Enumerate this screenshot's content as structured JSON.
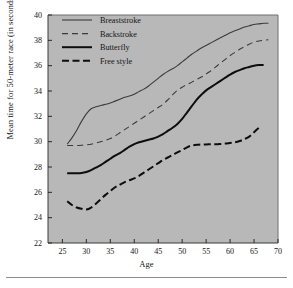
{
  "chart_data": {
    "type": "line",
    "title": "",
    "xlabel": "Age",
    "ylabel": "Mean time for 50-meter race (in seconds)",
    "xlim": [
      22,
      70
    ],
    "ylim": [
      22,
      40
    ],
    "xticks": [
      25,
      30,
      35,
      40,
      45,
      50,
      55,
      60,
      65,
      70
    ],
    "yticks": [
      22,
      24,
      26,
      28,
      30,
      32,
      34,
      36,
      38,
      40
    ],
    "grid": false,
    "legend_position": "top-left-inside",
    "plot_background": "#b8b8b8",
    "page_background": "#ffffff",
    "series": [
      {
        "name": "Breaststroke",
        "style": "thin-solid",
        "color": "#3b3b3b",
        "linewidth": 1.1,
        "dash": "none",
        "x": [
          26,
          27,
          28,
          29,
          30,
          31,
          32,
          33,
          34,
          35,
          36,
          37,
          38,
          39,
          40,
          41,
          42,
          43,
          44,
          45,
          46,
          47,
          48,
          49,
          50,
          51,
          52,
          53,
          54,
          55,
          56,
          57,
          58,
          59,
          60,
          61,
          62,
          63,
          64,
          65,
          66,
          67,
          68
        ],
        "y": [
          29.8,
          30.3,
          30.9,
          31.6,
          32.2,
          32.6,
          32.75,
          32.85,
          32.95,
          33.05,
          33.2,
          33.35,
          33.5,
          33.6,
          33.75,
          33.95,
          34.15,
          34.4,
          34.7,
          35.0,
          35.3,
          35.55,
          35.75,
          36.0,
          36.3,
          36.6,
          36.9,
          37.15,
          37.4,
          37.6,
          37.8,
          38.0,
          38.2,
          38.4,
          38.6,
          38.75,
          38.9,
          39.05,
          39.15,
          39.25,
          39.3,
          39.35,
          39.35
        ]
      },
      {
        "name": "Backstroke",
        "style": "thin-dashed",
        "color": "#3b3b3b",
        "linewidth": 1.1,
        "dash": "6,4",
        "x": [
          26,
          27,
          28,
          29,
          30,
          31,
          32,
          33,
          34,
          35,
          36,
          37,
          38,
          39,
          40,
          41,
          42,
          43,
          44,
          45,
          46,
          47,
          48,
          49,
          50,
          51,
          52,
          53,
          54,
          55,
          56,
          57,
          58,
          59,
          60,
          61,
          62,
          63,
          64,
          65,
          66,
          67,
          68
        ],
        "y": [
          29.7,
          29.7,
          29.7,
          29.72,
          29.75,
          29.8,
          29.9,
          30.0,
          30.1,
          30.25,
          30.45,
          30.7,
          30.95,
          31.2,
          31.45,
          31.7,
          31.95,
          32.2,
          32.45,
          32.7,
          32.95,
          33.3,
          33.7,
          34.05,
          34.3,
          34.5,
          34.7,
          34.9,
          35.1,
          35.35,
          35.6,
          35.9,
          36.2,
          36.5,
          36.8,
          37.05,
          37.3,
          37.5,
          37.7,
          37.85,
          37.95,
          38.0,
          38.05
        ]
      },
      {
        "name": "Butterfly",
        "style": "thick-solid",
        "color": "#0d0d0d",
        "linewidth": 2.0,
        "dash": "none",
        "x": [
          26,
          27,
          28,
          29,
          30,
          31,
          32,
          33,
          34,
          35,
          36,
          37,
          38,
          39,
          40,
          41,
          42,
          43,
          44,
          45,
          46,
          47,
          48,
          49,
          50,
          51,
          52,
          53,
          54,
          55,
          56,
          57,
          58,
          59,
          60,
          61,
          62,
          63,
          64,
          65,
          66,
          67
        ],
        "y": [
          27.5,
          27.5,
          27.5,
          27.52,
          27.6,
          27.75,
          27.95,
          28.15,
          28.4,
          28.65,
          28.9,
          29.1,
          29.35,
          29.6,
          29.8,
          29.95,
          30.05,
          30.15,
          30.25,
          30.4,
          30.6,
          30.85,
          31.1,
          31.4,
          31.8,
          32.3,
          32.8,
          33.3,
          33.7,
          34.05,
          34.3,
          34.55,
          34.8,
          35.05,
          35.3,
          35.5,
          35.65,
          35.8,
          35.9,
          36.0,
          36.05,
          36.05
        ]
      },
      {
        "name": "Free style",
        "style": "thick-dashed",
        "color": "#0d0d0d",
        "linewidth": 2.0,
        "dash": "7,3.5",
        "x": [
          26,
          27,
          28,
          29,
          30,
          31,
          32,
          33,
          34,
          35,
          36,
          37,
          38,
          39,
          40,
          41,
          42,
          43,
          44,
          45,
          46,
          47,
          48,
          49,
          50,
          51,
          52,
          53,
          54,
          55,
          56,
          57,
          58,
          59,
          60,
          61,
          62,
          63,
          64,
          65,
          66
        ],
        "y": [
          25.3,
          25.0,
          24.8,
          24.7,
          24.65,
          24.8,
          25.1,
          25.45,
          25.8,
          26.1,
          26.4,
          26.6,
          26.8,
          26.95,
          27.1,
          27.3,
          27.55,
          27.8,
          28.05,
          28.3,
          28.55,
          28.75,
          28.95,
          29.15,
          29.35,
          29.55,
          29.7,
          29.75,
          29.78,
          29.78,
          29.8,
          29.8,
          29.82,
          29.85,
          29.9,
          29.95,
          30.05,
          30.2,
          30.4,
          30.75,
          31.1
        ]
      }
    ]
  },
  "legend": {
    "items": [
      {
        "label": "Breaststroke"
      },
      {
        "label": "Backstroke"
      },
      {
        "label": "Butterfly"
      },
      {
        "label": "Free style"
      }
    ]
  }
}
